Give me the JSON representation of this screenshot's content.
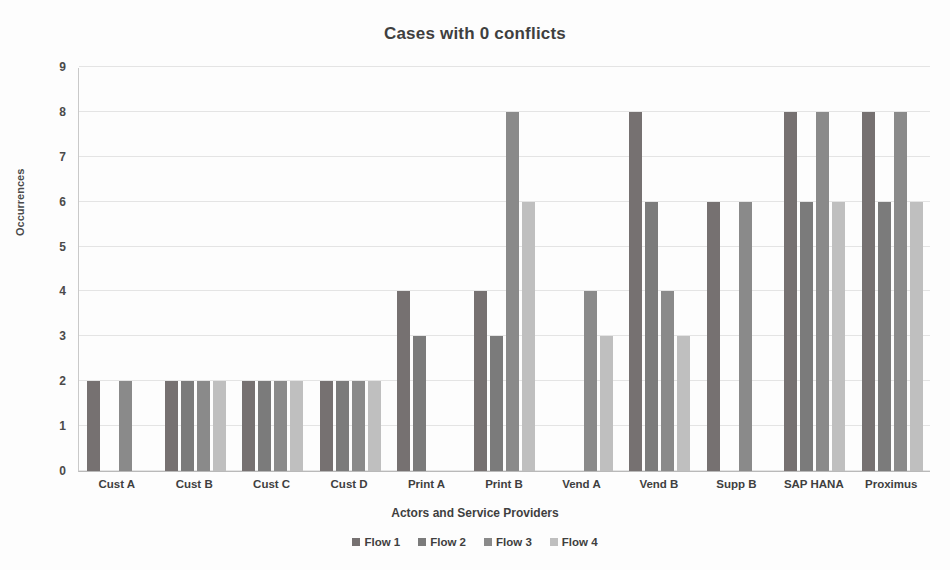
{
  "chart_data": {
    "type": "bar",
    "title": "Cases with 0 conflicts",
    "xlabel": "Actors and Service Providers",
    "ylabel": "Occurrences",
    "ylim": [
      0,
      9
    ],
    "yticks": [
      0,
      1,
      2,
      3,
      4,
      5,
      6,
      7,
      8,
      9
    ],
    "grid": true,
    "legend_position": "bottom",
    "categories": [
      "Cust A",
      "Cust B",
      "Cust C",
      "Cust D",
      "Print A",
      "Print B",
      "Vend A",
      "Vend B",
      "Supp B",
      "SAP HANA",
      "Proximus"
    ],
    "series": [
      {
        "name": "Flow 1",
        "color": "#767171",
        "values": [
          2,
          2,
          2,
          2,
          4,
          4,
          0,
          8,
          6,
          8,
          8
        ]
      },
      {
        "name": "Flow 2",
        "color": "#7b7b7b",
        "values": [
          0,
          2,
          2,
          2,
          3,
          3,
          0,
          6,
          0,
          6,
          6
        ]
      },
      {
        "name": "Flow 3",
        "color": "#8a8a8a",
        "values": [
          2,
          2,
          2,
          2,
          0,
          8,
          4,
          4,
          6,
          8,
          8
        ]
      },
      {
        "name": "Flow 4",
        "color": "#bfbfbf",
        "values": [
          0,
          2,
          2,
          2,
          0,
          6,
          3,
          3,
          0,
          6,
          6
        ]
      }
    ]
  },
  "legend": {
    "items": [
      {
        "label": "Flow 1",
        "color": "#767171"
      },
      {
        "label": "Flow 2",
        "color": "#7b7b7b"
      },
      {
        "label": "Flow 3",
        "color": "#8a8a8a"
      },
      {
        "label": "Flow 4",
        "color": "#bfbfbf"
      }
    ]
  }
}
